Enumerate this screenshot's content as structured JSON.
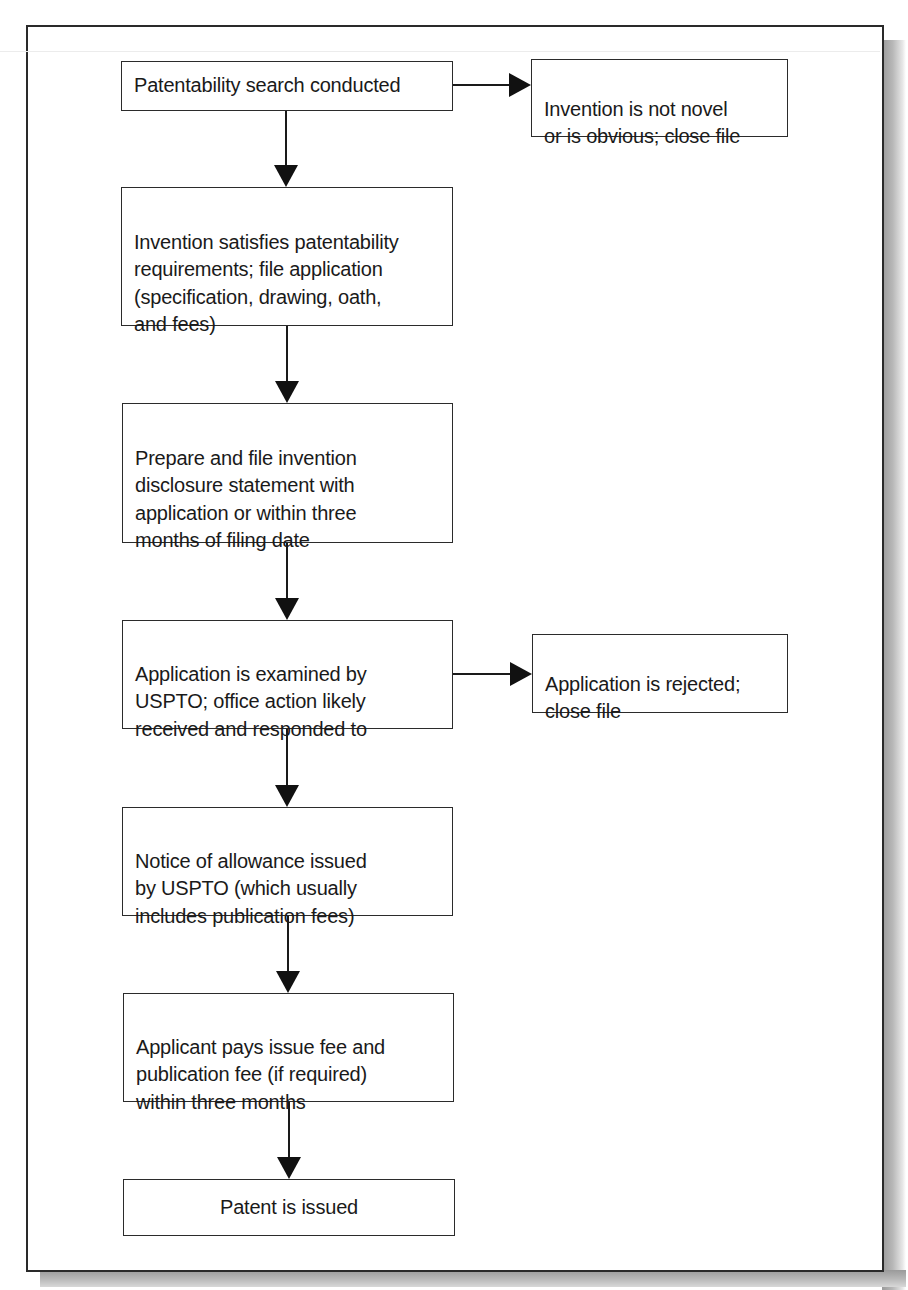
{
  "diagram": {
    "type": "flowchart",
    "nodes": {
      "search": "Patentability search conducted",
      "not_novel": "Invention is not novel\nor is obvious; close file",
      "file_application": "Invention satisfies patentability\nrequirements; file application\n(specification, drawing, oath,\nand fees)",
      "disclosure": "Prepare and file invention\ndisclosure statement with\napplication or within three\nmonths of filing date",
      "examined": "Application is examined by\nUSPTO; office action likely\nreceived and responded to",
      "rejected": "Application is rejected;\nclose file",
      "allowance": "Notice of allowance issued\nby USPTO (which usually\nincludes publication fees)",
      "pays_fee": "Applicant pays issue fee and\npublication fee (if required)\nwithin three months",
      "issued": "Patent is issued"
    },
    "edges": [
      {
        "from": "search",
        "to": "not_novel"
      },
      {
        "from": "search",
        "to": "file_application"
      },
      {
        "from": "file_application",
        "to": "disclosure"
      },
      {
        "from": "disclosure",
        "to": "examined"
      },
      {
        "from": "examined",
        "to": "rejected"
      },
      {
        "from": "examined",
        "to": "allowance"
      },
      {
        "from": "allowance",
        "to": "pays_fee"
      },
      {
        "from": "pays_fee",
        "to": "issued"
      }
    ]
  }
}
